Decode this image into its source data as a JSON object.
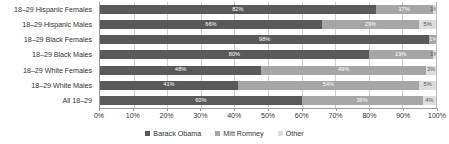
{
  "chart_data": {
    "type": "bar",
    "subtype": "stacked-horizontal-100pct",
    "title": "",
    "xlabel": "",
    "ylabel": "",
    "xlim": [
      0,
      100
    ],
    "xticks": [
      "0%",
      "10%",
      "20%",
      "30%",
      "40%",
      "50%",
      "60%",
      "70%",
      "80%",
      "90%",
      "100%"
    ],
    "grid": true,
    "legend_position": "bottom-center",
    "categories": [
      "18–29 Hispanic Females",
      "18–29 Hispanic Males",
      "18–29 Black Females",
      "18–29 Black Males",
      "18–29 White Females",
      "18–29 White Males",
      "All 18–29"
    ],
    "series": [
      {
        "name": "Barack Obama",
        "color": "#595959",
        "values": [
          82,
          66,
          98,
          80,
          48,
          41,
          60
        ],
        "labels": [
          "82%",
          "66%",
          "98%",
          "80%",
          "48%",
          "41%",
          "60%"
        ]
      },
      {
        "name": "Mitt Romney",
        "color": "#a6a6a6",
        "values": [
          17,
          29,
          1,
          19,
          49,
          54,
          36
        ],
        "labels": [
          "17%",
          "29%",
          "1%",
          "19%",
          "49%",
          "54%",
          "36%"
        ]
      },
      {
        "name": "Other",
        "color": "#dddddd",
        "values": [
          1,
          5,
          1,
          1,
          3,
          5,
          4
        ],
        "labels": [
          "1%",
          "5%",
          "1%",
          "1%",
          "3%",
          "5%",
          "4%"
        ]
      }
    ]
  },
  "legend": {
    "items": [
      {
        "label": "Barack Obama"
      },
      {
        "label": "Mitt Romney"
      },
      {
        "label": "Other"
      }
    ]
  }
}
